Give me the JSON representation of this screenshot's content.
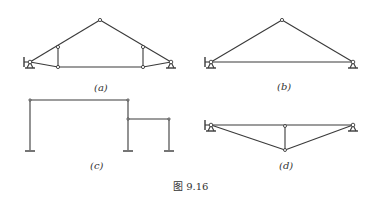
{
  "figure": {
    "caption": "图 9.16",
    "line_color": "#3a3a3a",
    "background": "#ffffff",
    "subfigures": [
      {
        "id": "a",
        "label": "(a)",
        "type": "truss",
        "nodes": {
          "left_support": [
            30,
            62
          ],
          "apex": [
            100,
            20
          ],
          "left_vertical_top": [
            58,
            47
          ],
          "left_vertical_bottom": [
            58,
            67
          ],
          "right_vertical_top": [
            143,
            47
          ],
          "right_vertical_bottom": [
            143,
            67
          ],
          "right_support": [
            171,
            62
          ]
        },
        "supports": [
          "fixed-hinge-left",
          "roller-right"
        ]
      },
      {
        "id": "b",
        "label": "(b)",
        "type": "three-bar-truss",
        "nodes": {
          "left_support": [
            211,
            62
          ],
          "apex": [
            282,
            20
          ],
          "right_support": [
            353,
            62
          ]
        },
        "supports": [
          "fixed-hinge-left",
          "roller-right"
        ]
      },
      {
        "id": "c",
        "label": "(c)",
        "type": "frame",
        "nodes": {
          "top_left": [
            30,
            100
          ],
          "top_right": [
            128,
            100
          ],
          "step_joint": [
            128,
            119
          ],
          "right_beam_end": [
            169,
            119
          ],
          "base_left": [
            30,
            150
          ],
          "base_middle": [
            128,
            150
          ],
          "base_right": [
            169,
            150
          ]
        },
        "supports": [
          "fixed",
          "fixed",
          "fixed"
        ]
      },
      {
        "id": "d",
        "label": "(d)",
        "type": "trussed-beam",
        "nodes": {
          "left_support": [
            211,
            125
          ],
          "mid_top": [
            285,
            126
          ],
          "mid_bottom": [
            285,
            150
          ],
          "right_support": [
            353,
            125
          ]
        },
        "supports": [
          "fixed-hinge-left",
          "roller-right"
        ]
      }
    ]
  }
}
